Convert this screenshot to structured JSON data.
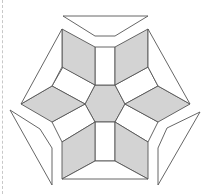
{
  "figure": {
    "colors": {
      "gray_fill": "#d3d3d3",
      "white_fill": "#ffffff",
      "stroke": "#555555",
      "dashed_border": "#c8c8c8"
    },
    "pieces": [
      {
        "id": "center-hexagon",
        "fill": "gray",
        "points": "95,85 115,85 125,104 115,122 95,122 85,104"
      },
      {
        "id": "top-rectangle",
        "fill": "white",
        "points": "95,47 115,47 115,85 95,85"
      },
      {
        "id": "bottom-rectangle",
        "fill": "white",
        "points": "95,122 115,122 115,161 95,161"
      },
      {
        "id": "upper-left-rectangle",
        "fill": "white",
        "points": "63,67 95,85 85,104 52,86"
      },
      {
        "id": "upper-right-rectangle",
        "fill": "white",
        "points": "115,85 148,67 158,86 125,104"
      },
      {
        "id": "lower-left-rectangle",
        "fill": "white",
        "points": "52,122 85,104 95,122 62,142"
      },
      {
        "id": "lower-right-rectangle",
        "fill": "white",
        "points": "125,104 158,122 148,142 115,122"
      },
      {
        "id": "top-left-rhombus",
        "fill": "gray",
        "points": "62,29 95,47 95,85 62,67"
      },
      {
        "id": "top-right-rhombus",
        "fill": "gray",
        "points": "115,47 148,29 148,67 115,85"
      },
      {
        "id": "left-rhombus",
        "fill": "gray",
        "points": "21,104 52,86 85,104 52,122"
      },
      {
        "id": "right-rhombus",
        "fill": "gray",
        "points": "125,104 158,86 190,104 158,122"
      },
      {
        "id": "bottom-left-rhombus",
        "fill": "gray",
        "points": "62,142 95,122 95,161 62,179"
      },
      {
        "id": "bottom-right-rhombus",
        "fill": "gray",
        "points": "115,122 148,142 148,179 115,161"
      },
      {
        "id": "upper-left-trapezoid",
        "fill": "white",
        "points": "62,29 62,67 52,86 21,104"
      },
      {
        "id": "upper-right-trapezoid",
        "fill": "white",
        "points": "148,29 190,104 158,86 148,67"
      },
      {
        "id": "bottom-trapezoid",
        "fill": "white",
        "points": "62,179 95,161 115,161 148,179"
      },
      {
        "id": "top-detached-trapezoid",
        "fill": "white",
        "points": "63,16 148,16 115,36 95,36"
      },
      {
        "id": "bottom-left-detached-trapezoid",
        "fill": "white",
        "points": "10,110 40,129 52,148 52,185"
      },
      {
        "id": "bottom-right-detached-trapezoid",
        "fill": "white",
        "points": "200,112 158,185 158,148 167,128"
      }
    ]
  }
}
